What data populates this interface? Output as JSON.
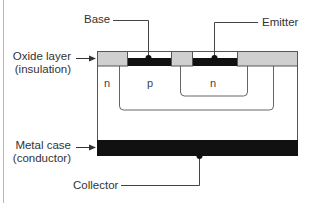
{
  "diagram": {
    "labels": {
      "base": "Base",
      "emitter": "Emitter",
      "oxide_line1": "Oxide layer",
      "oxide_line2": "(insulation)",
      "metal_line1": "Metal case",
      "metal_line2": "(conductor)",
      "collector": "Collector"
    },
    "regions": {
      "collector_n": "n",
      "base_p": "p",
      "emitter_n": "n"
    },
    "colors": {
      "oxide": "#cfcfcf",
      "metal": "#111111",
      "line": "#444444",
      "text": "#333333",
      "border": "#b8b8b8"
    }
  }
}
